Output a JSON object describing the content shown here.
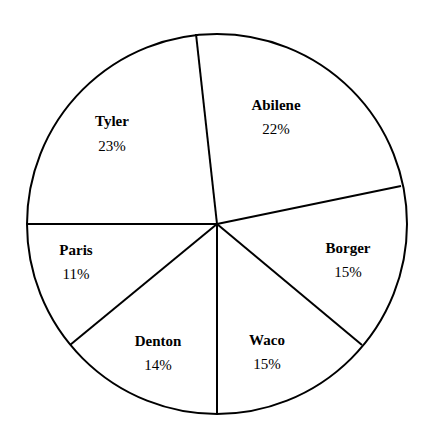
{
  "chart_data": {
    "type": "pie",
    "title": "",
    "categories": [
      "Abilene",
      "Borger",
      "Waco",
      "Denton",
      "Paris",
      "Tyler"
    ],
    "values": [
      22,
      15,
      15,
      14,
      11,
      23
    ],
    "unit": "%",
    "labels": [
      {
        "name": "Abilene",
        "pct": "22%"
      },
      {
        "name": "Borger",
        "pct": "15%"
      },
      {
        "name": "Waco",
        "pct": "15%"
      },
      {
        "name": "Denton",
        "pct": "14%"
      },
      {
        "name": "Paris",
        "pct": "11%"
      },
      {
        "name": "Tyler",
        "pct": "23%"
      }
    ],
    "legend": "none (labels inside slices)",
    "stroke_color": "#000000",
    "fill_color": "#ffffff",
    "background": "#ffffff",
    "geometry": {
      "cx": 217,
      "cy": 224,
      "r": 190,
      "boundaries": [
        {
          "between": [
            "Tyler",
            "Abilene"
          ],
          "x": 196,
          "y": 34
        },
        {
          "between": [
            "Abilene",
            "Borger"
          ],
          "x": 401,
          "y": 186
        },
        {
          "between": [
            "Borger",
            "Waco"
          ],
          "x": 362,
          "y": 345
        },
        {
          "between": [
            "Waco",
            "Denton"
          ],
          "x": 217,
          "y": 415
        },
        {
          "between": [
            "Denton",
            "Paris"
          ],
          "x": 70,
          "y": 345
        },
        {
          "between": [
            "Paris",
            "Tyler"
          ],
          "x": 27,
          "y": 224
        }
      ],
      "label_positions": [
        {
          "name": "Abilene",
          "x": 276,
          "name_y": 110,
          "pct_y": 134
        },
        {
          "name": "Borger",
          "x": 348,
          "name_y": 253,
          "pct_y": 277
        },
        {
          "name": "Waco",
          "x": 267,
          "name_y": 345,
          "pct_y": 369
        },
        {
          "name": "Denton",
          "x": 158,
          "name_y": 346,
          "pct_y": 370
        },
        {
          "name": "Paris",
          "x": 76,
          "name_y": 255,
          "pct_y": 279
        },
        {
          "name": "Tyler",
          "x": 112,
          "name_y": 126,
          "pct_y": 151
        }
      ]
    },
    "measured_slice_percent_from_geometry": {
      "Abilene": 22,
      "Borger": 15,
      "Waco": 15,
      "Denton": 11,
      "Paris": 14,
      "Tyler": 23
    },
    "note": "The printed labels read Denton 14% and Paris 11%. Measured from the drawn slice angles, Denton is about 11% and Paris about 14%, so these two labels appear swapped relative to their slice sizes. The printed labels are recorded as shown."
  }
}
